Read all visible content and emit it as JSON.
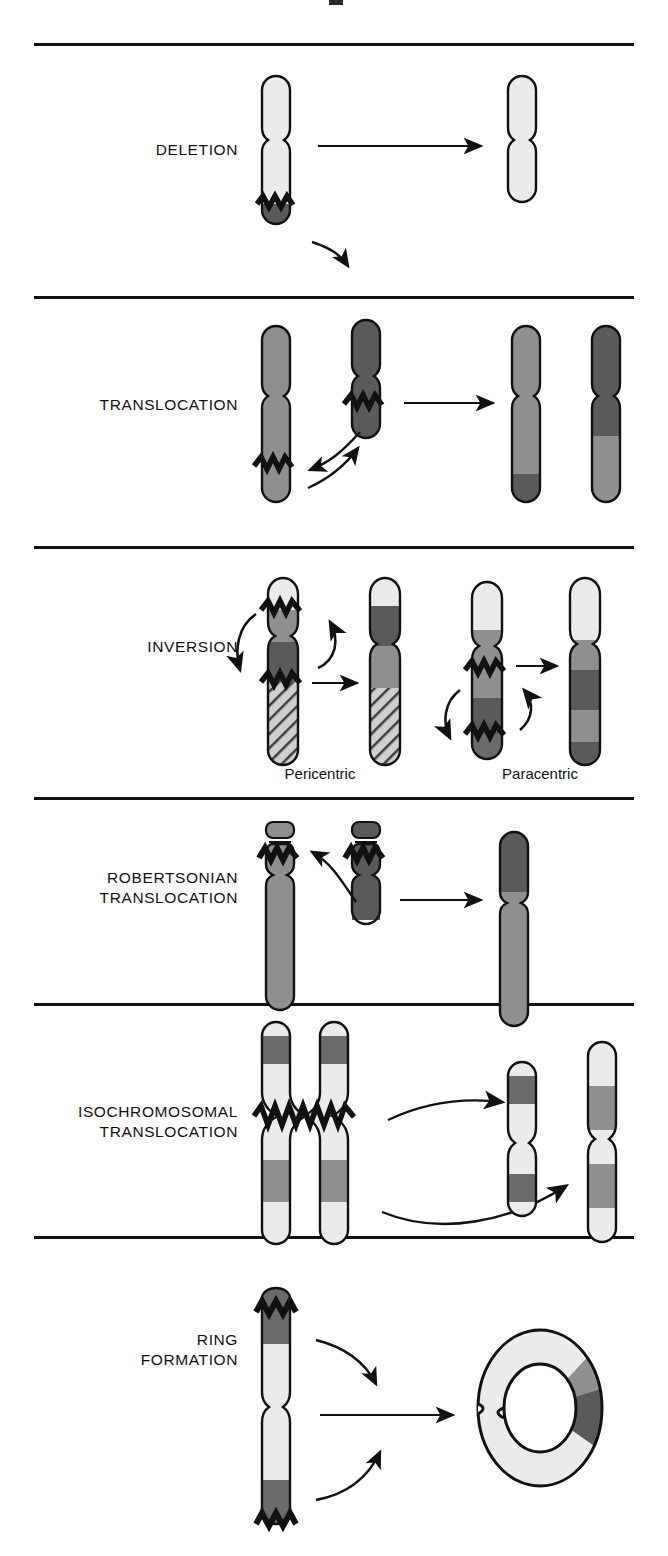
{
  "figure": {
    "background": "#ffffff",
    "width": 668,
    "height": 1556
  },
  "palette": {
    "outline": "#111111",
    "very_light": "#ebebeb",
    "light": "#d8d8d8",
    "medium": "#8f8f8f",
    "dark": "#5a5a5a",
    "darker": "#4a4a4a",
    "rule": "#111111"
  },
  "rows": [
    {
      "id": "deletion",
      "label": "DELETION",
      "sublabels": [],
      "description": "A terminal segment breaks off a chromosome and is lost, leaving a shortened chromosome."
    },
    {
      "id": "translocation",
      "label": "TRANSLOCATION",
      "sublabels": [],
      "description": "Segments are exchanged between two non-homologous chromosomes."
    },
    {
      "id": "inversion",
      "label": "INVERSION",
      "sublabels": [
        "Pericentric",
        "Paracentric"
      ],
      "description": "A chromosome segment breaks at two points, rotates 180 degrees and reinserts."
    },
    {
      "id": "robertsonian-translocation",
      "label": "ROBERTSONIAN\nTRANSLOCATION",
      "sublabels": [],
      "description": "Two acrocentric chromosomes fuse at the centromere and the short arms are lost."
    },
    {
      "id": "isochromosomal-translocation",
      "label": "ISOCHROMOSOMAL\nTRANSLOCATION",
      "sublabels": [],
      "description": "Transverse centromere division yields chromosomes with two identical arms."
    },
    {
      "id": "ring-formation",
      "label": "RING\nFORMATION",
      "sublabels": [],
      "description": "Both telomeric ends break off and the sticky ends fuse into a ring chromosome."
    }
  ],
  "legend_markers": {
    "break_point": "zigzag-break",
    "movement": "curved-arrow",
    "result": "straight-arrow"
  }
}
